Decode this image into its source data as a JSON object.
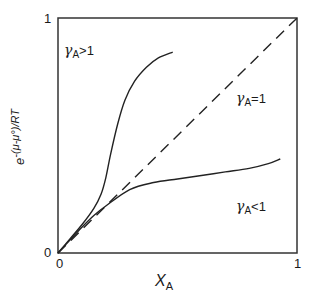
{
  "chart_data": {
    "type": "line",
    "title": "",
    "xlabel": "X_A",
    "ylabel": "e^((μ-μ°)/RT)",
    "xlim": [
      0,
      1
    ],
    "ylim": [
      0,
      1
    ],
    "grid": false,
    "legend": null,
    "x_ticks": [
      "0",
      "1"
    ],
    "y_ticks": [
      "0",
      "1"
    ],
    "series": [
      {
        "name": "γA>1",
        "style": "solid",
        "x": [
          0,
          0.05,
          0.1,
          0.15,
          0.18,
          0.2,
          0.22,
          0.25,
          0.28,
          0.32,
          0.37,
          0.42,
          0.48
        ],
        "y": [
          0,
          0.06,
          0.12,
          0.19,
          0.25,
          0.32,
          0.42,
          0.55,
          0.65,
          0.73,
          0.79,
          0.83,
          0.855
        ]
      },
      {
        "name": "γA=1",
        "style": "dashed",
        "x": [
          0,
          1
        ],
        "y": [
          0,
          1
        ]
      },
      {
        "name": "γA<1",
        "style": "solid",
        "x": [
          0,
          0.05,
          0.1,
          0.15,
          0.2,
          0.3,
          0.4,
          0.5,
          0.6,
          0.7,
          0.8,
          0.88,
          0.93
        ],
        "y": [
          0,
          0.055,
          0.11,
          0.16,
          0.2,
          0.27,
          0.3,
          0.315,
          0.33,
          0.345,
          0.36,
          0.38,
          0.4
        ]
      }
    ],
    "annotations": [
      {
        "text": "γA>1",
        "x": 0.05,
        "y": 0.88
      },
      {
        "text": "γA=1",
        "x": 0.75,
        "y": 0.62
      },
      {
        "text": "γA<1",
        "x": 0.75,
        "y": 0.19
      }
    ]
  },
  "labels": {
    "x_axis_symbol": "X",
    "x_axis_sub": "A",
    "y_axis_base": "e",
    "y_axis_exp": "-(μ-μ°)/RT",
    "tick_x0": "0",
    "tick_x1": "1",
    "tick_y0": "0",
    "tick_y1": "1",
    "gamma": "γ",
    "sub_A": "A",
    "annot_gt": ">1",
    "annot_eq": "=1",
    "annot_lt": "<1"
  }
}
